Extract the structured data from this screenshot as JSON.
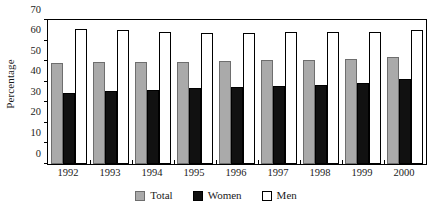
{
  "chart_data": {
    "type": "bar",
    "title": "",
    "xlabel": "",
    "ylabel": "Percentage",
    "ylim": [
      0,
      70
    ],
    "yticks": [
      0,
      10,
      20,
      30,
      40,
      50,
      60,
      70
    ],
    "grid": false,
    "legend_position": "bottom",
    "categories": [
      "1992",
      "1993",
      "1994",
      "1995",
      "1996",
      "1997",
      "1998",
      "1999",
      "2000"
    ],
    "series": [
      {
        "name": "Total",
        "color": "#aaaaaa",
        "values": [
          49.0,
          49.5,
          49.5,
          49.5,
          50.3,
          50.5,
          50.8,
          51.0,
          52.0
        ]
      },
      {
        "name": "Women",
        "color": "#111111",
        "values": [
          34.3,
          35.3,
          35.8,
          36.8,
          37.3,
          37.8,
          38.5,
          39.3,
          41.3
        ]
      },
      {
        "name": "Men",
        "color": "#ffffff",
        "values": [
          65.5,
          65.2,
          64.2,
          63.8,
          63.8,
          64.0,
          64.3,
          64.1,
          65.0
        ]
      }
    ]
  }
}
